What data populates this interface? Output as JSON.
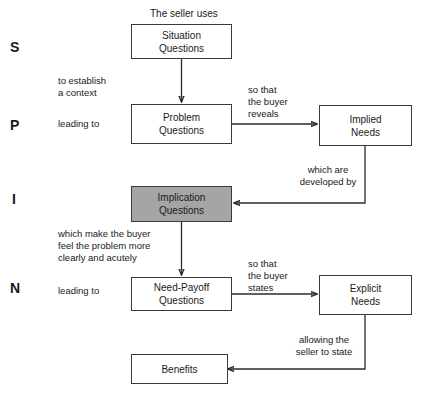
{
  "diagram": {
    "title_note": "The seller uses",
    "stage_letters": [
      {
        "letter": "S",
        "name": "situation"
      },
      {
        "letter": "P",
        "name": "problem"
      },
      {
        "letter": "I",
        "name": "implication"
      },
      {
        "letter": "N",
        "name": "need-payoff"
      }
    ],
    "boxes": [
      {
        "id": "situation",
        "line1": "Situation",
        "line2": "Questions",
        "shaded": false
      },
      {
        "id": "problem",
        "line1": "Problem",
        "line2": "Questions",
        "shaded": false
      },
      {
        "id": "implied-needs",
        "line1": "Implied",
        "line2": "Needs",
        "shaded": false
      },
      {
        "id": "implication",
        "line1": "Implication",
        "line2": "Questions",
        "shaded": true
      },
      {
        "id": "need-payoff",
        "line1": "Need-Payoff",
        "line2": "Questions",
        "shaded": false
      },
      {
        "id": "explicit-needs",
        "line1": "Explicit",
        "line2": "Needs",
        "shaded": false
      },
      {
        "id": "benefits",
        "line1": "Benefits",
        "line2": "",
        "shaded": false
      }
    ],
    "connector_labels": [
      {
        "id": "establish-context",
        "text": "to establish\na context"
      },
      {
        "id": "leading-to-problem",
        "text": "leading to"
      },
      {
        "id": "buyer-reveals",
        "text": "so that\nthe buyer\nreveals"
      },
      {
        "id": "developed-by",
        "text": "which are\ndeveloped by"
      },
      {
        "id": "feel-problem",
        "text": "which make the buyer\nfeel the problem more\nclearly and acutely"
      },
      {
        "id": "leading-to-need-payoff",
        "text": "leading to"
      },
      {
        "id": "buyer-states",
        "text": "so that\nthe buyer\nstates"
      },
      {
        "id": "seller-to-state",
        "text": "allowing the\nseller to state"
      }
    ],
    "colors": {
      "shaded_fill": "#a5a5a5",
      "line": "#2b2b2b",
      "text": "#1a1a1a",
      "background": "#ffffff"
    }
  }
}
